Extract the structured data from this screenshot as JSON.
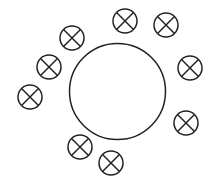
{
  "diagram": {
    "stroke_color": "#222222",
    "background": "#ffffff",
    "center_circle": {
      "cx": 117.5,
      "cy": 91.5,
      "r": 48
    },
    "lamp_radius": 12,
    "lamps": [
      {
        "cx": 125,
        "cy": 21
      },
      {
        "cx": 166,
        "cy": 25
      },
      {
        "cx": 190,
        "cy": 68
      },
      {
        "cx": 186,
        "cy": 123
      },
      {
        "cx": 111,
        "cy": 163
      },
      {
        "cx": 80,
        "cy": 147
      },
      {
        "cx": 30,
        "cy": 97
      },
      {
        "cx": 49,
        "cy": 67
      },
      {
        "cx": 72,
        "cy": 38
      }
    ]
  }
}
